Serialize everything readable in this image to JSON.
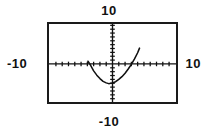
{
  "window_labels": {
    "y_max": "10",
    "y_min": "-10",
    "x_min": "-10",
    "x_max": "10"
  },
  "colors": {
    "ink": "#111111",
    "frame": "#1a1a1a",
    "background": "#ffffff"
  },
  "chart_data": {
    "type": "line",
    "title": "",
    "xlabel": "",
    "ylabel": "",
    "xlim": [
      -10,
      10
    ],
    "ylim": [
      -10,
      10
    ],
    "grid": false,
    "legend": null,
    "x_tick_labels": [
      "-10",
      "10"
    ],
    "y_tick_labels": [
      "-10",
      "10"
    ],
    "tick_spacing": 1,
    "axes": {
      "x_axis_y": 0,
      "y_axis_x": 0,
      "tick_count_x": 20,
      "tick_count_y": 20
    },
    "annotations": [
      {
        "text": "10",
        "position": "top"
      },
      {
        "text": "-10",
        "position": "bottom"
      },
      {
        "text": "-10",
        "position": "left"
      },
      {
        "text": "10",
        "position": "right"
      }
    ],
    "series": [
      {
        "name": "parabola",
        "shape": "upward parabola",
        "vertex": [
          -0.6,
          -5.1
        ],
        "x_intercepts": [
          -3.7,
          3.8
        ],
        "y_intercept": -4.9,
        "x": [
          -3.9,
          -3.5,
          -3.0,
          -2.5,
          -2.0,
          -1.5,
          -1.0,
          -0.6,
          0.0,
          0.5,
          1.0,
          1.5,
          2.0,
          2.5,
          3.0,
          3.5,
          4.0,
          4.3
        ],
        "y": [
          0.7,
          -0.3,
          -1.8,
          -2.9,
          -3.8,
          -4.5,
          -4.9,
          -5.1,
          -4.9,
          -4.6,
          -4.0,
          -3.3,
          -2.4,
          -1.3,
          -0.1,
          1.3,
          2.9,
          4.1
        ]
      }
    ]
  }
}
